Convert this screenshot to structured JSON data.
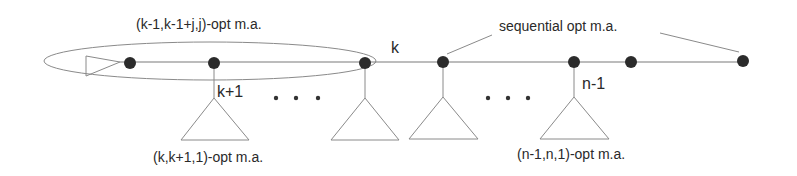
{
  "diagram": {
    "type": "tree-path",
    "labels": {
      "ellipse_label": "(k-1,k-1+j,j)-opt m.a.",
      "node_k": "k",
      "sequential": "sequential opt m.a.",
      "node_k_plus_1": "k+1",
      "node_n_minus_1": "n-1",
      "subtree_left": "(k,k+1,1)-opt m.a.",
      "subtree_right": "(n-1,n,1)-opt m.a.",
      "ellipsis_left": ". . .",
      "ellipsis_right": ". . ."
    },
    "nodes": [
      {
        "id": "n1",
        "x": 130,
        "y": 62
      },
      {
        "id": "n2",
        "x": 214,
        "y": 62,
        "label": "k+1"
      },
      {
        "id": "n3",
        "x": 365,
        "y": 62
      },
      {
        "id": "n4",
        "x": 443,
        "y": 62
      },
      {
        "id": "n5",
        "x": 574,
        "y": 62,
        "label": "n-1"
      },
      {
        "id": "n6",
        "x": 631,
        "y": 62
      },
      {
        "id": "n7",
        "x": 743,
        "y": 62
      }
    ],
    "subtrees": [
      {
        "attach_x": 214
      },
      {
        "attach_x": 365
      },
      {
        "attach_x": 443
      },
      {
        "attach_x": 574
      }
    ],
    "colors": {
      "line": "#7a7a7a",
      "node": "#2b2b2b",
      "text": "#2a2a2a"
    }
  }
}
